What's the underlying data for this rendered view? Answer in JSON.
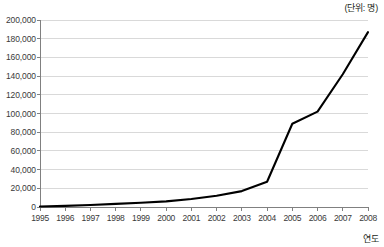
{
  "unit_note": "(단위: 명)",
  "axis_label_x": "연도",
  "chart_data": {
    "type": "line",
    "title": "",
    "subtitle": "",
    "xlabel": "연도",
    "ylabel": "",
    "unit_note": "(단위: 명)",
    "categories": [
      "1995",
      "1996",
      "1997",
      "1998",
      "1999",
      "2000",
      "2001",
      "2002",
      "2003",
      "2004",
      "2005",
      "2006",
      "2007",
      "2008"
    ],
    "values": [
      500,
      1200,
      2200,
      3300,
      4500,
      6000,
      8500,
      12000,
      17000,
      27000,
      89000,
      102000,
      142000,
      187000
    ],
    "series": [
      {
        "name": "누적 인원",
        "values": [
          500,
          1200,
          2200,
          3300,
          4500,
          6000,
          8500,
          12000,
          17000,
          27000,
          89000,
          102000,
          142000,
          187000
        ]
      }
    ],
    "ylim": [
      0,
      200000
    ],
    "yticks": [
      0,
      20000,
      40000,
      60000,
      80000,
      100000,
      120000,
      140000,
      160000,
      180000,
      200000
    ],
    "ytick_labels": [
      "0",
      "20,000",
      "40,000",
      "60,000",
      "80,000",
      "100,000",
      "120,000",
      "140,000",
      "160,000",
      "180,000",
      "200,000"
    ],
    "xlim": [
      "1995",
      "2008"
    ],
    "grid": true,
    "grid_axis": "y",
    "legend": false,
    "legend_position": "none",
    "line_color": "#000000",
    "grid_color": "#d9d9d9",
    "axis_color": "#808080",
    "background_color": "#ffffff"
  }
}
